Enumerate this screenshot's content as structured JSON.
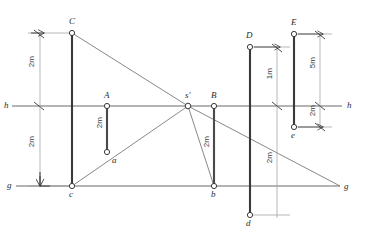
{
  "figure": {
    "type": "technical-drawing",
    "width": 365,
    "height": 250,
    "stroke_color": "#4a4a4a",
    "heavy_stroke_color": "#3a3a3a",
    "background": "#ffffff"
  },
  "reference_lines": {
    "horizon": {
      "name": "h",
      "y": 106,
      "x1": 12,
      "x2": 342,
      "label_left": "h",
      "label_right": "h"
    },
    "ground": {
      "name": "g",
      "y": 186,
      "x1": 16,
      "x2": 340,
      "label_left": "g",
      "label_right": "g"
    }
  },
  "points": {
    "C": {
      "label": "C",
      "x": 72,
      "y": 33
    },
    "c": {
      "label": "c",
      "x": 72,
      "y": 186
    },
    "A": {
      "label": "A",
      "x": 107,
      "y": 106
    },
    "a": {
      "label": "a",
      "x": 107,
      "y": 152
    },
    "s_prime": {
      "label": "s'",
      "x": 188,
      "y": 106
    },
    "B": {
      "label": "B",
      "x": 214,
      "y": 106
    },
    "b": {
      "label": "b",
      "x": 214,
      "y": 186
    },
    "D": {
      "label": "D",
      "x": 250,
      "y": 47
    },
    "d": {
      "label": "d",
      "x": 250,
      "y": 215
    },
    "E": {
      "label": "E",
      "x": 294,
      "y": 34
    },
    "e": {
      "label": "e",
      "x": 294,
      "y": 127
    },
    "g_right": {
      "label": "g",
      "x": 340,
      "y": 186
    }
  },
  "vertical_segments": [
    {
      "name": "segment-Cc",
      "top": "C",
      "bottom": "c",
      "x": 72
    },
    {
      "name": "segment-Aa",
      "top": "A",
      "bottom": "a",
      "x": 107
    },
    {
      "name": "segment-Bb",
      "top": "B",
      "bottom": "b",
      "x": 214
    },
    {
      "name": "segment-Dd",
      "top": "D",
      "bottom": "d",
      "x": 250
    },
    {
      "name": "segment-Ee",
      "top": "E",
      "bottom": "e",
      "x": 294
    }
  ],
  "dimensions": [
    {
      "name": "dim-C-to-h",
      "text": "2m",
      "axis": "vertical",
      "x": 40,
      "y1": 33,
      "y2": 106,
      "label_x": 28,
      "label_y": 58
    },
    {
      "name": "dim-h-to-g-left",
      "text": "2m",
      "axis": "vertical",
      "x": 40,
      "y1": 106,
      "y2": 186,
      "label_x": 28,
      "label_y": 134
    },
    {
      "name": "dim-A-to-a",
      "text": "2m",
      "axis": "vertical",
      "x": 107,
      "y1": 106,
      "y2": 152,
      "label_x": 96,
      "label_y": 118
    },
    {
      "name": "dim-B-to-b",
      "text": "2m",
      "axis": "vertical",
      "x": 214,
      "y1": 106,
      "y2": 186,
      "label_x": 203,
      "label_y": 134
    },
    {
      "name": "dim-D-to-h",
      "text": "1m",
      "axis": "vertical",
      "x": 277,
      "y1": 47,
      "y2": 106,
      "label_x": 266,
      "label_y": 68
    },
    {
      "name": "dim-d-to-g",
      "text": "2m",
      "axis": "vertical",
      "x": 277,
      "y1": 186,
      "y2": 215,
      "label_x": 266,
      "label_y": 152
    },
    {
      "name": "dim-E-to-h",
      "text": "5m",
      "axis": "vertical",
      "x": 320,
      "y1": 34,
      "y2": 106,
      "label_x": 309,
      "label_y": 58
    },
    {
      "name": "dim-h-to-e",
      "text": "2m",
      "axis": "vertical",
      "x": 320,
      "y1": 106,
      "y2": 127,
      "label_x": 309,
      "label_y": 106
    }
  ],
  "construction_rays": [
    {
      "name": "ray-C-to-g-right",
      "from": "C",
      "to": "g_right",
      "through": "s_prime"
    },
    {
      "name": "ray-c-to-s-prime",
      "from": "c",
      "to": "s_prime",
      "through": "a"
    },
    {
      "name": "ray-s-prime-to-c",
      "from": "s_prime",
      "to": "c"
    },
    {
      "name": "ray-s-prime-to-b",
      "from": "s_prime",
      "to": "b"
    }
  ],
  "labels": {
    "C": "C",
    "c": "c",
    "A": "A",
    "a": "a",
    "s_prime": "s'",
    "B": "B",
    "b": "b",
    "D": "D",
    "d": "d",
    "E": "E",
    "e": "e",
    "h_left": "h",
    "h_right": "h",
    "g_left": "g",
    "g_right": "g"
  }
}
